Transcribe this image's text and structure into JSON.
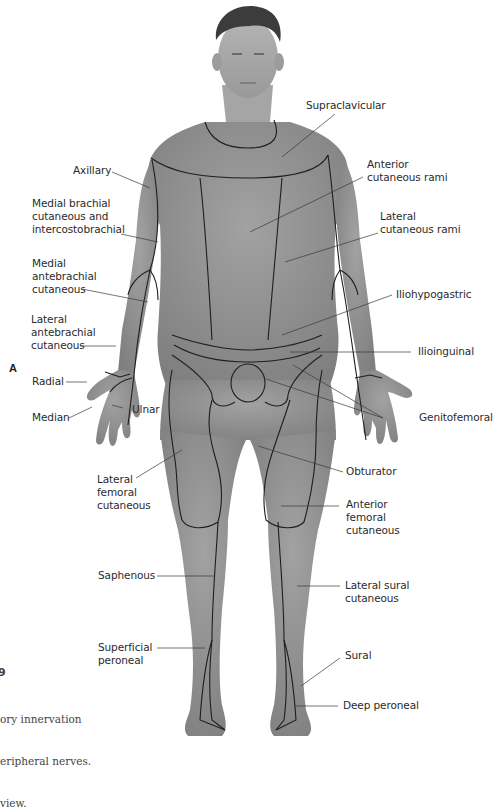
{
  "figure": {
    "panel_letter": "A",
    "figure_number_fragment": "9",
    "caption_lines": [
      "ory innervation",
      "eripheral nerves.",
      "view."
    ],
    "colors": {
      "skin": "#8a8a8a",
      "skin_light": "#9a9a9a",
      "hair": "#3c3c3c",
      "boundary_line": "#1e1e1e",
      "leader_line": "#3a3a3a",
      "label_text": "#2b2b2b",
      "background": "#ffffff"
    }
  },
  "labels": {
    "supraclavicular": "Supraclavicular",
    "anterior_cutaneous_rami": "Anterior\ncutaneous rami",
    "axillary": "Axillary",
    "medial_brachial": "Medial brachial\ncutaneous and\nintercostobrachial",
    "lateral_cutaneous_rami": "Lateral\ncutaneous rami",
    "medial_antebrachial": "Medial\nantebrachial\ncutaneous",
    "iliohypogastric": "Iliohypogastric",
    "lateral_antebrachial": "Lateral\nantebrachial\ncutaneous",
    "ilioinguinal": "Ilioinguinal",
    "radial": "Radial",
    "median": "Median",
    "ulnar": "Ulnar",
    "genitofemoral": "Genitofemoral",
    "lateral_femoral": "Lateral\nfemoral\ncutaneous",
    "obturator": "Obturator",
    "anterior_femoral": "Anterior\nfemoral\ncutaneous",
    "saphenous": "Saphenous",
    "lateral_sural": "Lateral sural\ncutaneous",
    "superficial_peroneal": "Superficial\nperoneal",
    "sural": "Sural",
    "deep_peroneal": "Deep peroneal"
  }
}
